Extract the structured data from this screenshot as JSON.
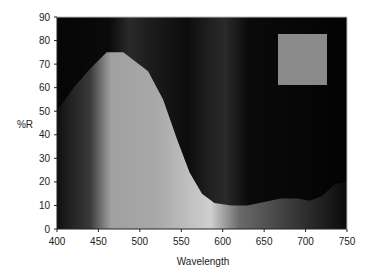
{
  "chart_data": {
    "type": "area",
    "title": "",
    "xlabel": "Wavelength",
    "ylabel": "%R",
    "xlim": [
      400,
      750
    ],
    "ylim": [
      0,
      90
    ],
    "xticks": [
      400,
      450,
      500,
      550,
      600,
      650,
      700,
      750
    ],
    "yticks": [
      0,
      10,
      20,
      30,
      40,
      50,
      60,
      70,
      80,
      90
    ],
    "grid": false,
    "legend": {
      "position": "upper right",
      "entries": [
        {
          "swatch_color": "#8a8a8a",
          "label": ""
        }
      ]
    },
    "series": [
      {
        "name": "%R",
        "x": [
          400,
          420,
          440,
          460,
          480,
          495,
          510,
          528,
          545,
          560,
          575,
          590,
          610,
          630,
          650,
          670,
          690,
          705,
          720,
          735,
          750
        ],
        "values": [
          50,
          60,
          68,
          75,
          75,
          71,
          67,
          55,
          38,
          24,
          15,
          11,
          10,
          10,
          11.5,
          13,
          13,
          12,
          14,
          19,
          20
        ]
      }
    ],
    "background": {
      "above_curve": "#050505",
      "under_curve_spectrum": [
        {
          "wavelength": 400,
          "color": "#101010"
        },
        {
          "wavelength": 440,
          "color": "#3a3a3a"
        },
        {
          "wavelength": 465,
          "color": "#a0a0a0"
        },
        {
          "wavelength": 520,
          "color": "#a8a8a8"
        },
        {
          "wavelength": 585,
          "color": "#cfcfcf"
        },
        {
          "wavelength": 620,
          "color": "#6a6a6a"
        },
        {
          "wavelength": 680,
          "color": "#3c3c3c"
        },
        {
          "wavelength": 750,
          "color": "#0a0a0a"
        }
      ]
    }
  }
}
